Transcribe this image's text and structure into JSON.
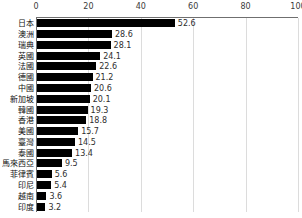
{
  "chart_data": {
    "type": "bar",
    "orientation": "horizontal",
    "title": "",
    "subtitle": "",
    "xlabel": "",
    "ylabel": "",
    "xlim": [
      0,
      100
    ],
    "xticks": [
      0,
      20,
      40,
      60,
      80,
      100
    ],
    "xtick_labels": [
      "0",
      "20",
      "40",
      "60",
      "80",
      "100"
    ],
    "grid": true,
    "grid_axis": "x",
    "legend": false,
    "legend_position": "none",
    "bar_color": "#000000",
    "grid_color": "#dcdcdc",
    "axis_color": "#6f6f6f",
    "categories": [
      "日本",
      "澳洲",
      "瑞典",
      "英國",
      "法國",
      "德國",
      "中國",
      "新加坡",
      "韓國",
      "香港",
      "美國",
      "臺灣",
      "泰國",
      "馬來西亞",
      "菲律賓",
      "印尼",
      "越南",
      "印度"
    ],
    "values": [
      52.6,
      28.6,
      28.1,
      24.1,
      22.6,
      21.2,
      20.6,
      20.1,
      19.3,
      18.8,
      15.7,
      14.5,
      13.4,
      9.5,
      5.6,
      5.4,
      3.6,
      3.2
    ],
    "value_labels": [
      "52.6",
      "28.6",
      "28.1",
      "24.1",
      "22.6",
      "21.2",
      "20.6",
      "20.1",
      "19.3",
      "18.8",
      "15.7",
      "14.5",
      "13.4",
      "9.5",
      "5.6",
      "5.4",
      "3.6",
      "3.2"
    ]
  }
}
